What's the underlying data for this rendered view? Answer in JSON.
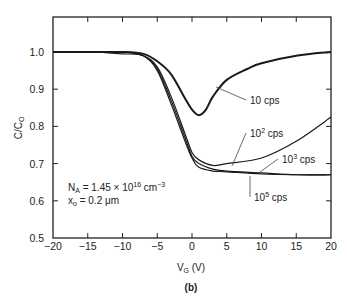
{
  "chart_data": {
    "type": "line",
    "title": "",
    "panel_label": "(b)",
    "xlabel": "V_G (V)",
    "ylabel": "C/C_O",
    "xlim": [
      -20,
      20
    ],
    "ylim": [
      0.5,
      1.05
    ],
    "xticks": [
      -20,
      -15,
      -10,
      -5,
      0,
      5,
      10,
      15,
      20
    ],
    "yticks": [
      0.5,
      0.6,
      0.7,
      0.8,
      0.9,
      1.0
    ],
    "xtick_labels": [
      "−20",
      "−15",
      "−10",
      "−5",
      "0",
      "5",
      "10",
      "15",
      "20"
    ],
    "ytick_labels": [
      "0.5",
      "0.6",
      "0.7",
      "0.8",
      "0.9",
      "1.0"
    ],
    "grid": false,
    "annotations": [
      {
        "text": "N_A = 1.45 × 10^16 cm^-3"
      },
      {
        "text": "x_o = 0.2 μm"
      }
    ],
    "series": [
      {
        "name": "10 cps",
        "x": [
          -20,
          -15,
          -10,
          -7,
          -5,
          -3,
          -1,
          0,
          1,
          2,
          3,
          5,
          8,
          10,
          15,
          20
        ],
        "y": [
          1.0,
          1.0,
          1.0,
          0.995,
          0.975,
          0.94,
          0.875,
          0.845,
          0.83,
          0.845,
          0.88,
          0.925,
          0.955,
          0.97,
          0.99,
          1.0
        ]
      },
      {
        "name": "10^2 cps",
        "x": [
          -20,
          -15,
          -10,
          -7,
          -5,
          -3,
          -1,
          0,
          1,
          3,
          5,
          10,
          15,
          20
        ],
        "y": [
          1.0,
          1.0,
          1.0,
          0.99,
          0.96,
          0.88,
          0.78,
          0.73,
          0.71,
          0.695,
          0.7,
          0.715,
          0.76,
          0.825
        ]
      },
      {
        "name": "10^3 cps",
        "x": [
          -20,
          -15,
          -10,
          -7,
          -5,
          -3,
          -1,
          0,
          1,
          3,
          5,
          10,
          15,
          20
        ],
        "y": [
          1.0,
          1.0,
          1.0,
          0.99,
          0.955,
          0.87,
          0.77,
          0.72,
          0.7,
          0.685,
          0.68,
          0.675,
          0.67,
          0.67
        ]
      },
      {
        "name": "10^5 cps",
        "x": [
          -20,
          -15,
          -10,
          -7,
          -5,
          -3,
          -1,
          0,
          1,
          3,
          5,
          10,
          15,
          20
        ],
        "y": [
          1.0,
          1.0,
          0.995,
          0.99,
          0.95,
          0.86,
          0.76,
          0.715,
          0.69,
          0.68,
          0.678,
          0.672,
          0.67,
          0.67
        ]
      }
    ],
    "legend_labels": [
      {
        "base": "10",
        "sup": "",
        "suffix": " cps"
      },
      {
        "base": "10",
        "sup": "2",
        "suffix": " cps"
      },
      {
        "base": "10",
        "sup": "3",
        "suffix": " cps"
      },
      {
        "base": "10",
        "sup": "5",
        "suffix": " cps"
      }
    ]
  },
  "labels": {
    "ylabel_main": "C/C",
    "ylabel_sub": "O",
    "xlabel_main": "V",
    "xlabel_sub": "G",
    "xlabel_unit": " (V)",
    "panel": "(b)",
    "ann1_main": "N",
    "ann1_sub": "A",
    "ann1_rest": " = 1.45 × 10",
    "ann1_sup": "16",
    "ann1_unit": " cm",
    "ann1_unit_sup": "−3",
    "ann2_main": "x",
    "ann2_sub": "o",
    "ann2_rest": " = 0.2 μm"
  }
}
